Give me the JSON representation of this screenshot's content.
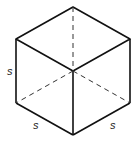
{
  "diagram": {
    "labels": {
      "left_edge": "s",
      "bottom_left_edge": "s",
      "bottom_right_edge": "s"
    },
    "colors": {
      "edge": "#111111",
      "hidden_edge": "#333333",
      "label": "#222222"
    }
  }
}
